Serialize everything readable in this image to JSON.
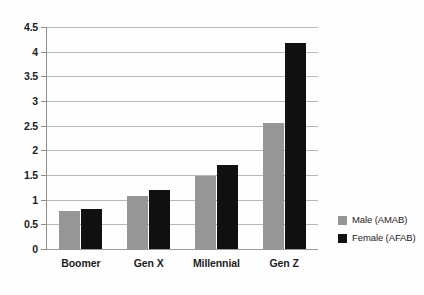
{
  "chart_data": {
    "type": "bar",
    "title": "",
    "xlabel": "",
    "ylabel": "",
    "categories": [
      "Boomer",
      "Gen X",
      "Millennial",
      "Gen Z"
    ],
    "series": [
      {
        "name": "Male (AMAB)",
        "color": "#969696",
        "values": [
          0.78,
          1.08,
          1.48,
          2.55
        ]
      },
      {
        "name": "Female (AFAB)",
        "color": "#111111",
        "values": [
          0.82,
          1.2,
          1.7,
          4.17
        ]
      }
    ],
    "ylim": [
      0,
      4.5
    ],
    "ytick_labels": [
      "4.5",
      "4",
      "3.5",
      "3",
      "2.5",
      "2",
      "1.5",
      "1",
      "0.5",
      "0"
    ],
    "ytick_values": [
      4.5,
      4,
      3.5,
      3,
      2.5,
      2,
      1.5,
      1,
      0.5,
      0
    ],
    "grid": true,
    "grid_axis": "y",
    "legend_position": "right",
    "background_color": "#ffffff",
    "gridline_color": "#b9b9b9",
    "axis_color": "#8c8c8c",
    "text_color": "#1c1c1c"
  }
}
